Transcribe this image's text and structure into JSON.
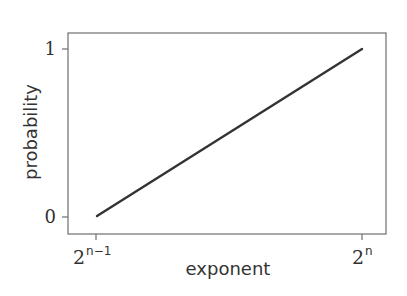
{
  "chart_data": {
    "type": "line",
    "title": "",
    "xlabel": "exponent",
    "ylabel": "probability",
    "x_ticks": [
      {
        "base": "2",
        "sup": "n−1"
      },
      {
        "base": "2",
        "sup": "n"
      }
    ],
    "y_ticks": [
      "0",
      "1"
    ],
    "series": [
      {
        "name": "probability",
        "x": [
          "2^(n-1)",
          "2^n"
        ],
        "values": [
          0,
          1
        ],
        "color": "#333333"
      }
    ],
    "ylim": [
      0,
      1
    ],
    "grid": false,
    "legend": null
  }
}
